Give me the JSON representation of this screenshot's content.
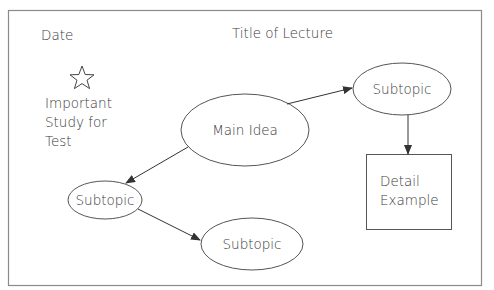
{
  "header": {
    "date_label": "Date",
    "title_label": "Title of Lecture"
  },
  "note": {
    "icon": "star-icon",
    "lines": [
      "Important",
      "Study for",
      "Test"
    ]
  },
  "nodes": {
    "main": "Main Idea",
    "subtopic_top_right": "Subtopic",
    "subtopic_left": "Subtopic",
    "subtopic_bottom": "Subtopic",
    "detail_line1": "Detail",
    "detail_line2": "Example"
  },
  "colors": {
    "stroke": "#555555",
    "frame": "#8a8a8a",
    "text": "#3a3a3a"
  }
}
